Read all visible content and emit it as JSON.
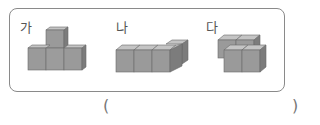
{
  "problem": {
    "figures": [
      {
        "label": "가",
        "description": "4 cubes: 3 in a row on the bottom, 1 stacked on top of the middle cube"
      },
      {
        "label": "나",
        "description": "4 cubes on one layer: 3 in a row with 1 attached behind the right end (L shape)"
      },
      {
        "label": "다",
        "description": "4 cubes on one layer arranged in a 2x2 square"
      }
    ],
    "answer_open_paren": "(",
    "answer_close_paren": ")",
    "answer_value": ""
  },
  "colors": {
    "frame_border": "#8a8a8a",
    "cube_front": "#9a9a9a",
    "cube_top": "#c4c4c4",
    "cube_side": "#7c7c7c",
    "cube_edge": "#6a6a6a"
  }
}
